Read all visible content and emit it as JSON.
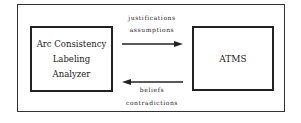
{
  "diagram": {
    "left_box": {
      "lines": [
        "Arc Consistency",
        "Labeling",
        "Analyzer"
      ]
    },
    "right_box": {
      "label": "ATMS"
    },
    "arrow_right": {
      "direction": "left-to-right",
      "labels": [
        "justifications",
        "assumptions"
      ]
    },
    "arrow_left": {
      "direction": "right-to-left",
      "labels": [
        "beliefs",
        "contradictions"
      ]
    }
  }
}
